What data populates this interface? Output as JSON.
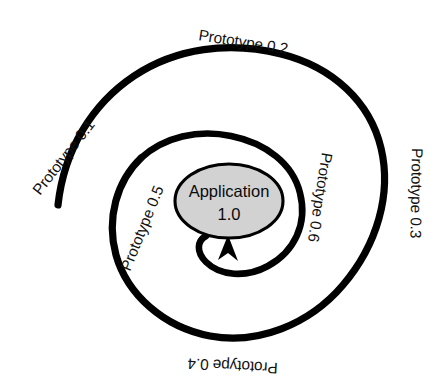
{
  "diagram": {
    "type": "spiral-lifecycle",
    "background_color": "#ffffff",
    "stroke_color": "#000000",
    "center": {
      "x": 230,
      "y": 200
    },
    "center_node": {
      "name": "Application 1.0",
      "line1": "Application",
      "line2": "1.0",
      "fill_color": "#d2d2d2",
      "stroke_color": "#000000",
      "cx": 229,
      "cy": 201,
      "rx": 54,
      "ry": 37
    },
    "arrowhead": {
      "label": "arrow into application node",
      "tip_x": 228,
      "tip_y": 238,
      "direction": "up"
    },
    "stages": [
      {
        "id": "prototype-0-1",
        "label": "Prototype 0.1",
        "position": "outer-left",
        "rotation_deg": -52,
        "x": 40,
        "y": 196
      },
      {
        "id": "prototype-0-2",
        "label": "Prototype 0.2",
        "position": "outer-top",
        "rotation_deg": 9,
        "x": 198,
        "y": 40
      },
      {
        "id": "prototype-0-3",
        "label": "Prototype 0.3",
        "position": "outer-right",
        "rotation_deg": 91,
        "x": 412,
        "y": 148
      },
      {
        "id": "prototype-0-4",
        "label": "Prototype 0.4",
        "position": "outer-bottom",
        "rotation_deg": 183,
        "x": 278,
        "y": 363
      },
      {
        "id": "prototype-0-5",
        "label": "Prototype 0.5",
        "position": "inner-left",
        "rotation_deg": -68,
        "x": 130,
        "y": 272
      },
      {
        "id": "prototype-0-6",
        "label": "Prototype 0.6",
        "position": "inner-right",
        "rotation_deg": 99,
        "x": 322,
        "y": 152
      }
    ]
  }
}
